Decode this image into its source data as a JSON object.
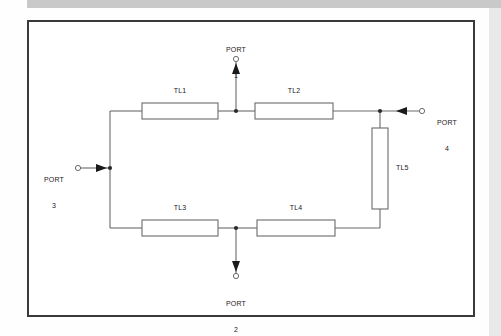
{
  "figure": {
    "type": "circuit-schematic",
    "background_color": "#ffffff",
    "border_color": "#3a3a3a",
    "line_color": "#6b6b6b",
    "text_color": "#1a1a1a",
    "top_bar_color": "#c9c9c9",
    "right_edge_color": "#e9e9e9"
  },
  "components": [
    {
      "id": "TL1",
      "label": "TL1",
      "orientation": "horizontal",
      "x": 142,
      "y": 103,
      "w": 76,
      "h": 16,
      "label_x": 180,
      "label_y": 90
    },
    {
      "id": "TL2",
      "label": "TL2",
      "orientation": "horizontal",
      "x": 255,
      "y": 103,
      "w": 78,
      "h": 16,
      "label_x": 294,
      "label_y": 90
    },
    {
      "id": "TL3",
      "label": "TL3",
      "orientation": "horizontal",
      "x": 142,
      "y": 220,
      "w": 76,
      "h": 16,
      "label_x": 180,
      "label_y": 207
    },
    {
      "id": "TL4",
      "label": "TL4",
      "orientation": "horizontal",
      "x": 257,
      "y": 220,
      "w": 78,
      "h": 16,
      "label_x": 296,
      "label_y": 207
    },
    {
      "id": "TL5",
      "label": "TL5",
      "orientation": "vertical",
      "x": 372,
      "y": 128,
      "w": 16,
      "h": 81,
      "label_x": 399,
      "label_y": 164
    }
  ],
  "ports": [
    {
      "id": "PORT1",
      "name": "PORT",
      "number": "1",
      "side": "top",
      "arrow_direction": "up",
      "label_x": 240,
      "label_y": 30,
      "terminal_x": 236,
      "terminal_y": 59,
      "junction_x": 236,
      "junction_y": 111
    },
    {
      "id": "PORT2",
      "name": "PORT",
      "number": "2",
      "side": "bottom",
      "arrow_direction": "down",
      "label_x": 238,
      "label_y": 285,
      "terminal_x": 236,
      "terminal_y": 276,
      "junction_x": 236,
      "junction_y": 228
    },
    {
      "id": "PORT3",
      "name": "PORT",
      "number": "3",
      "side": "left",
      "arrow_direction": "right",
      "label_x": 52,
      "label_y": 160,
      "terminal_x": 78,
      "terminal_y": 168,
      "junction_x": 110,
      "junction_y": 168
    },
    {
      "id": "PORT4",
      "name": "PORT",
      "number": "4",
      "side": "right",
      "arrow_direction": "left",
      "label_x": 443,
      "label_y": 103,
      "terminal_x": 422,
      "terminal_y": 111,
      "junction_x": 380,
      "junction_y": 111
    }
  ],
  "junctions": [
    {
      "id": "j-top-mid",
      "x": 236,
      "y": 111
    },
    {
      "id": "j-bottom-mid",
      "x": 236,
      "y": 228
    },
    {
      "id": "j-left-rail",
      "x": 110,
      "y": 168
    },
    {
      "id": "j-right-rail",
      "x": 380,
      "y": 111
    }
  ]
}
